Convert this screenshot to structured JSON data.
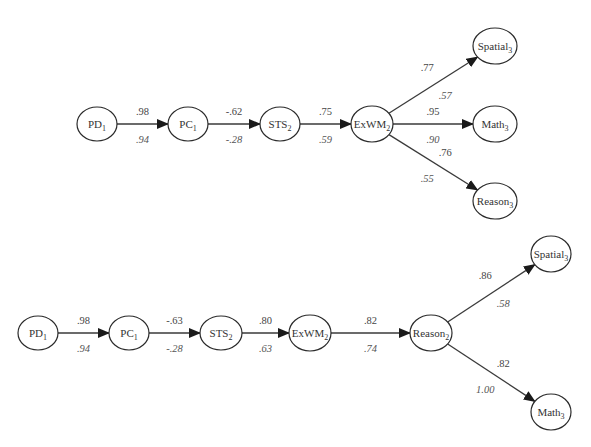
{
  "diagram": {
    "type": "path-model",
    "models": [
      {
        "id": "model-a",
        "nodes": [
          {
            "id": "PD1",
            "base": "PD",
            "sub": "1",
            "cx": 97,
            "cy": 124,
            "rx": 20,
            "ry": 17
          },
          {
            "id": "PC1",
            "base": "PC",
            "sub": "1",
            "cx": 188,
            "cy": 124,
            "rx": 20,
            "ry": 17
          },
          {
            "id": "STS2",
            "base": "STS",
            "sub": "2",
            "cx": 280,
            "cy": 124,
            "rx": 20,
            "ry": 17
          },
          {
            "id": "ExWM2",
            "base": "ExWM",
            "sub": "2",
            "cx": 372,
            "cy": 124,
            "rx": 21,
            "ry": 18
          },
          {
            "id": "Spatial3",
            "base": "Spatial",
            "sub": "3",
            "cx": 495,
            "cy": 46,
            "rx": 22,
            "ry": 18
          },
          {
            "id": "Math3",
            "base": "Math",
            "sub": "3",
            "cx": 495,
            "cy": 124,
            "rx": 22,
            "ry": 18
          },
          {
            "id": "Reason3",
            "base": "Reason",
            "sub": "3",
            "cx": 495,
            "cy": 201,
            "rx": 22,
            "ry": 18
          }
        ],
        "edges": [
          {
            "from": "PD1",
            "to": "PC1",
            "upper": ".98",
            "lower": ".94"
          },
          {
            "from": "PC1",
            "to": "STS2",
            "upper": "-.62",
            "lower": "-.28"
          },
          {
            "from": "STS2",
            "to": "ExWM2",
            "upper": ".75",
            "lower": ".59"
          },
          {
            "from": "ExWM2",
            "to": "Spatial3",
            "upper": ".77",
            "lower": ".57"
          },
          {
            "from": "ExWM2",
            "to": "Math3",
            "upper": ".95",
            "lower": ".90"
          },
          {
            "from": "ExWM2",
            "to": "Reason3",
            "upper": ".76",
            "lower": ".55"
          }
        ]
      },
      {
        "id": "model-b",
        "nodes": [
          {
            "id": "PD1",
            "base": "PD",
            "sub": "1",
            "cx": 38,
            "cy": 333,
            "rx": 20,
            "ry": 17
          },
          {
            "id": "PC1",
            "base": "PC",
            "sub": "1",
            "cx": 129,
            "cy": 333,
            "rx": 20,
            "ry": 17
          },
          {
            "id": "STS2",
            "base": "STS",
            "sub": "2",
            "cx": 221,
            "cy": 333,
            "rx": 21,
            "ry": 17
          },
          {
            "id": "ExWM2",
            "base": "ExWM",
            "sub": "2",
            "cx": 310,
            "cy": 333,
            "rx": 21,
            "ry": 18
          },
          {
            "id": "Reason2",
            "base": "Reason",
            "sub": "2",
            "cx": 431,
            "cy": 333,
            "rx": 21,
            "ry": 18
          },
          {
            "id": "Spatial3",
            "base": "Spatial",
            "sub": "3",
            "cx": 551,
            "cy": 254,
            "rx": 20,
            "ry": 18
          },
          {
            "id": "Math3",
            "base": "Math",
            "sub": "3",
            "cx": 551,
            "cy": 412,
            "rx": 20,
            "ry": 18
          }
        ],
        "edges": [
          {
            "from": "PD1",
            "to": "PC1",
            "upper": ".98",
            "lower": ".94"
          },
          {
            "from": "PC1",
            "to": "STS2",
            "upper": "-.63",
            "lower": "-.28"
          },
          {
            "from": "STS2",
            "to": "ExWM2",
            "upper": ".80",
            "lower": ".63"
          },
          {
            "from": "ExWM2",
            "to": "Reason2",
            "upper": ".82",
            "lower": ".74"
          },
          {
            "from": "Reason2",
            "to": "Spatial3",
            "upper": ".86",
            "lower": ".58"
          },
          {
            "from": "Reason2",
            "to": "Math3",
            "upper": ".82",
            "lower": "1.00"
          }
        ]
      }
    ],
    "colors": {
      "stroke": "#2a2a2a",
      "edge": "#3a3a3a",
      "background": "#ffffff"
    }
  }
}
